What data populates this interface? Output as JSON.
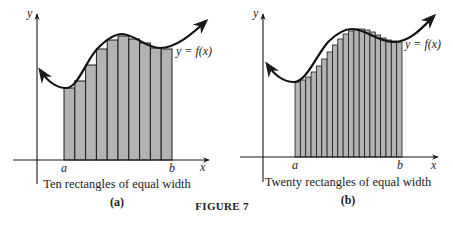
{
  "figure": {
    "title": "FIGURE 7"
  },
  "panels": [
    {
      "id": "a",
      "sublabel": "(a)",
      "caption": "Ten rectangles of equal width",
      "curve_label": "y = f(x)",
      "x_axis_label": "x",
      "y_axis_label": "y",
      "left_endpoint_label": "a",
      "right_endpoint_label": "b",
      "rect_count": 10
    },
    {
      "id": "b",
      "sublabel": "(b)",
      "caption": "Twenty rectangles of equal width",
      "curve_label": "y = f(x)",
      "x_axis_label": "x",
      "y_axis_label": "y",
      "left_endpoint_label": "a",
      "right_endpoint_label": "b",
      "rect_count": 20
    }
  ],
  "colors": {
    "rect_fill": "#b3b3b3",
    "stroke": "#1a1a1a",
    "text": "#222222"
  },
  "chart_data": [
    {
      "type": "bar",
      "title": "Ten rectangles of equal width",
      "xlabel": "x",
      "ylabel": "y",
      "categories": [
        "1",
        "2",
        "3",
        "4",
        "5",
        "6",
        "7",
        "8",
        "9",
        "10"
      ],
      "values": [
        72,
        79,
        95,
        111,
        120,
        124,
        121,
        117,
        112,
        111
      ],
      "notes": "Rectangle heights approximate an inscribed Riemann sum under y = f(x) from a to b (pixel heights above x-axis)"
    },
    {
      "type": "bar",
      "title": "Twenty rectangles of equal width",
      "xlabel": "x",
      "ylabel": "y",
      "categories": [
        "1",
        "2",
        "3",
        "4",
        "5",
        "6",
        "7",
        "8",
        "9",
        "10",
        "11",
        "12",
        "13",
        "14",
        "15",
        "16",
        "17",
        "18",
        "19",
        "20"
      ],
      "values": [
        75,
        77,
        80,
        85,
        91,
        98,
        105,
        112,
        118,
        123,
        126,
        128,
        128,
        127,
        125,
        122,
        119,
        117,
        116,
        115
      ],
      "notes": "Rectangle heights approximate an inscribed Riemann sum under y = f(x) from a to b (pixel heights above x-axis)"
    }
  ]
}
